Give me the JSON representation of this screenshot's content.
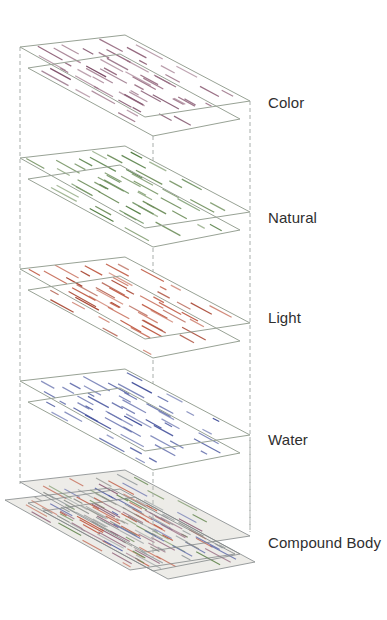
{
  "figure": {
    "canvas": {
      "width": 387,
      "height": 620,
      "background": "#ffffff"
    },
    "style": {
      "sheet_fill": "#ffffff",
      "sheet_outline_color": "#98a295",
      "compound_fill": "#edece8",
      "compound_outline_color": "#83888a",
      "guide_color": "#a8aeab",
      "label_color": "#2f2f2f"
    },
    "layers": [
      {
        "id": "color",
        "label": "Color",
        "y": 35,
        "label_top": 95,
        "dash_color": "#95697f",
        "dash_color_dark": "#7d4e68"
      },
      {
        "id": "natural",
        "label": "Natural",
        "y": 146,
        "label_top": 210,
        "dash_color": "#6f8f5c",
        "dash_color_dark": "#4e7a3e"
      },
      {
        "id": "light",
        "label": "Light",
        "y": 257,
        "label_top": 310,
        "dash_color": "#c2604a",
        "dash_color_dark": "#a84632"
      },
      {
        "id": "water",
        "label": "Water",
        "y": 369,
        "label_top": 432,
        "dash_color": "#5e6aaa",
        "dash_color_dark": "#45529c"
      },
      {
        "id": "compound",
        "label": "Compound Body",
        "y": 470,
        "label_top": 535,
        "dash_colors": [
          "#95697f",
          "#6f8f5c",
          "#c2604a",
          "#5e6aaa",
          "#8b8e89",
          "#9aa0a2"
        ]
      }
    ],
    "geometry": {
      "sheet_a": [
        [
          20,
          12
        ],
        [
          125,
          0
        ],
        [
          250,
          66
        ],
        [
          145,
          82
        ]
      ],
      "sheet_b": [
        [
          28,
          33
        ],
        [
          120,
          19
        ],
        [
          240,
          84
        ],
        [
          153,
          101
        ]
      ],
      "compound_quads": [
        {
          "ref": "a",
          "dx": 0,
          "dy": 0
        },
        {
          "ref": "b",
          "dx": 0,
          "dy": 0
        },
        {
          "ref": "a",
          "dx": -15,
          "dy": 18
        },
        {
          "ref": "b",
          "dx": 15,
          "dy": 8
        }
      ],
      "guides": [
        {
          "x": 20,
          "y1": 47,
          "y2": 484
        },
        {
          "x": 153,
          "y1": 136,
          "y2": 558
        },
        {
          "x": 250,
          "y1": 101,
          "y2": 530
        }
      ],
      "guide_overlays": [
        {
          "x": 153,
          "y1": 486,
          "y2": 558
        },
        {
          "x": 250,
          "y1": 440,
          "y2": 532
        }
      ]
    }
  }
}
